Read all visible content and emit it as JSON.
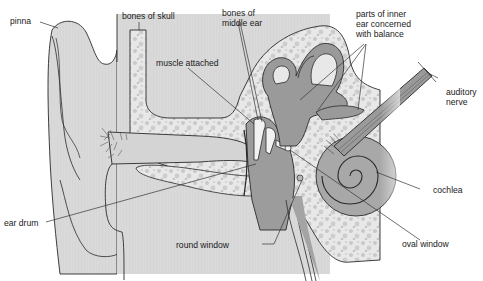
{
  "colors": {
    "outline": "#2a2a2a",
    "skin": "#d8d8d8",
    "bone": "#e6e6e6",
    "bone_speckle": "#c2c2c2",
    "inner_ear": "#9a9a9a",
    "inner_ear_light": "#b4b4b4",
    "canal": "#cfcfcf",
    "leader": "#333333"
  },
  "labels": {
    "pinna": "pinna",
    "bones_of_skull": "bones of skull",
    "bones_of_middle_ear_1": "bones of",
    "bones_of_middle_ear_2": "middle ear",
    "muscle_attached": "muscle attached",
    "inner_ear_balance_1": "parts of inner",
    "inner_ear_balance_2": "ear concerned",
    "inner_ear_balance_3": "with balance",
    "auditory_nerve_1": "auditory",
    "auditory_nerve_2": "nerve",
    "cochlea": "cochlea",
    "ear_drum": "ear drum",
    "round_window": "round window",
    "oval_window": "oval window"
  }
}
